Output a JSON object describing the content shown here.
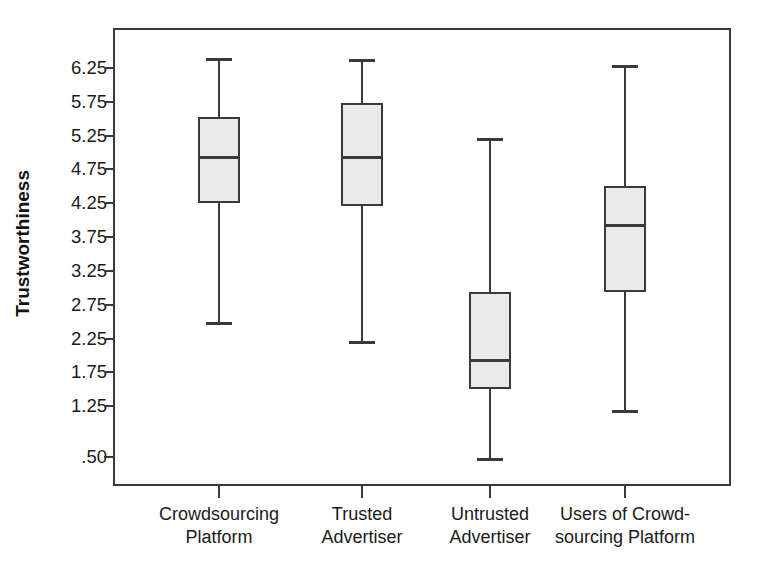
{
  "chart_data": {
    "type": "box",
    "title": "",
    "xlabel": "",
    "ylabel": "Trustworthiness",
    "ylim": [
      0.25,
      6.5
    ],
    "grid": false,
    "legend": null,
    "ytick_labels": [
      "6.25",
      "5.75",
      "5.25",
      "4.75",
      "4.25",
      "3.75",
      "3.25",
      "2.75",
      "2.25",
      "1.75",
      "1.25",
      ".50"
    ],
    "ytick_values": [
      6.25,
      5.75,
      5.25,
      4.75,
      4.25,
      3.75,
      3.25,
      2.75,
      2.25,
      1.75,
      1.25,
      0.5
    ],
    "categories": [
      "Crowdsourcing\nPlatform",
      "Trusted\nAdvertiser",
      "Untrusted\nAdvertiser",
      "Users of Crowd-\nsourcing Platform"
    ],
    "boxes": [
      {
        "category": "Crowdsourcing Platform",
        "whisker_low": 2.5,
        "q1": 4.25,
        "median": 4.95,
        "q3": 5.53,
        "whisker_high": 6.4
      },
      {
        "category": "Trusted Advertiser",
        "whisker_low": 2.22,
        "q1": 4.21,
        "median": 4.95,
        "q3": 5.73,
        "whisker_high": 6.38
      },
      {
        "category": "Untrusted Advertiser",
        "whisker_low": 0.48,
        "q1": 1.51,
        "median": 1.95,
        "q3": 2.94,
        "whisker_high": 5.22
      },
      {
        "category": "Users of Crowdsourcing Platform",
        "whisker_low": 1.2,
        "q1": 2.94,
        "median": 3.95,
        "q3": 4.51,
        "whisker_high": 6.3
      }
    ],
    "colors": {
      "box_fill": "#eaeaea",
      "line": "#3a3a3a",
      "text": "#1a1a1a",
      "background": "#ffffff"
    }
  }
}
